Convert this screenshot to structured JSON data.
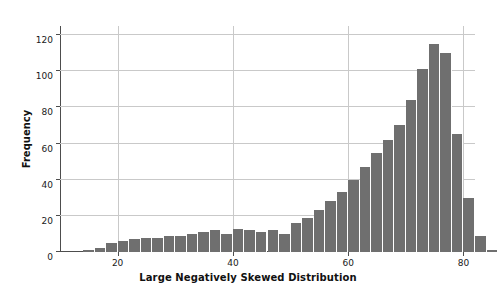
{
  "chart_data": {
    "type": "bar",
    "title": "",
    "subtitle": "",
    "xlabel": "Large Negatively Skewed Distribution",
    "ylabel": "Frequency",
    "xlim": [
      10,
      82
    ],
    "ylim": [
      0,
      125
    ],
    "xticks": [
      20,
      40,
      60,
      80
    ],
    "ytick_labels": [
      "0",
      "20",
      "40",
      "60",
      "80",
      "100",
      "120"
    ],
    "yticks": [
      0,
      20,
      40,
      60,
      80,
      100,
      120
    ],
    "grid": "both",
    "legend": "none",
    "bar_color": "#6f6f6f",
    "bar_edge_color": "#ffffff",
    "bin_width": 2,
    "bin_centers": [
      15,
      17,
      19,
      21,
      23,
      25,
      27,
      29,
      31,
      33,
      35,
      37,
      39,
      41,
      43,
      45,
      47,
      49,
      51,
      53,
      55,
      57,
      59,
      61,
      63,
      65,
      67,
      69,
      71,
      73,
      75,
      77,
      79
    ],
    "categories": [
      "15",
      "17",
      "19",
      "21",
      "23",
      "25",
      "27",
      "29",
      "31",
      "33",
      "35",
      "37",
      "39",
      "41",
      "43",
      "45",
      "47",
      "49",
      "51",
      "53",
      "55",
      "57",
      "59",
      "61",
      "63",
      "65",
      "67",
      "69",
      "71",
      "73",
      "75",
      "77",
      "79"
    ],
    "values": [
      1,
      2,
      5,
      6,
      7,
      8,
      8,
      9,
      9,
      10,
      11,
      12,
      10,
      13,
      12,
      11,
      12,
      10,
      16,
      19,
      23,
      28,
      33,
      40,
      47,
      55,
      62,
      70,
      84,
      101,
      115,
      110,
      65
    ],
    "bars": [
      {
        "center": 15,
        "frequency": 1
      },
      {
        "center": 17,
        "frequency": 2
      },
      {
        "center": 19,
        "frequency": 5
      },
      {
        "center": 21,
        "frequency": 6
      },
      {
        "center": 23,
        "frequency": 7
      },
      {
        "center": 25,
        "frequency": 8
      },
      {
        "center": 27,
        "frequency": 8
      },
      {
        "center": 29,
        "frequency": 9
      },
      {
        "center": 31,
        "frequency": 9
      },
      {
        "center": 33,
        "frequency": 10
      },
      {
        "center": 35,
        "frequency": 11
      },
      {
        "center": 37,
        "frequency": 12
      },
      {
        "center": 39,
        "frequency": 10
      },
      {
        "center": 41,
        "frequency": 13
      },
      {
        "center": 43,
        "frequency": 12
      },
      {
        "center": 45,
        "frequency": 11
      },
      {
        "center": 47,
        "frequency": 12
      },
      {
        "center": 49,
        "frequency": 10
      },
      {
        "center": 51,
        "frequency": 16
      },
      {
        "center": 53,
        "frequency": 19
      },
      {
        "center": 55,
        "frequency": 23
      },
      {
        "center": 57,
        "frequency": 28
      },
      {
        "center": 59,
        "frequency": 33
      },
      {
        "center": 61,
        "frequency": 40
      },
      {
        "center": 63,
        "frequency": 47
      },
      {
        "center": 65,
        "frequency": 55
      },
      {
        "center": 67,
        "frequency": 62
      },
      {
        "center": 69,
        "frequency": 70
      },
      {
        "center": 71,
        "frequency": 84
      },
      {
        "center": 73,
        "frequency": 101
      },
      {
        "center": 75,
        "frequency": 115
      },
      {
        "center": 77,
        "frequency": 110
      },
      {
        "center": 79,
        "frequency": 65
      }
    ],
    "tail": [
      {
        "center": 81,
        "frequency": 30
      },
      {
        "center": 83,
        "frequency": 9
      },
      {
        "center": 85,
        "frequency": 1
      }
    ]
  }
}
